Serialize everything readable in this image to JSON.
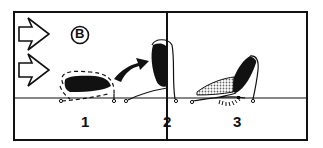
{
  "panel": {
    "badge": "B",
    "stages": [
      {
        "number": "1",
        "description": "flat dark shape with dashed outline"
      },
      {
        "number": "2",
        "description": "shape lifted upright"
      },
      {
        "number": "3",
        "description": "shape tilted with stippled area and hatched pivot"
      }
    ],
    "arrows": [
      "right-arrow-outline",
      "right-arrow-outline",
      "curved-arrow"
    ],
    "colors": {
      "ink": "#111111",
      "background": "#ffffff",
      "stipple": "#888888"
    }
  }
}
